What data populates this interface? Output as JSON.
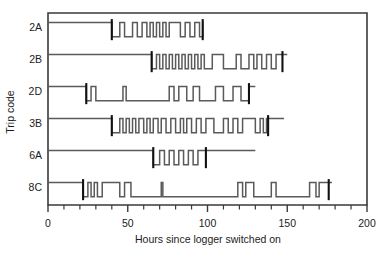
{
  "chart_data": {
    "type": "line",
    "title": "",
    "xlabel": "Hours since logger switched on",
    "ylabel": "Trip code",
    "xlim": [
      0,
      200
    ],
    "xticks": [
      0,
      50,
      100,
      150,
      200
    ],
    "xtick_labels": [
      "0",
      "50",
      "100",
      "150",
      "200"
    ],
    "x_minor_tick_step": 10,
    "grid": false,
    "legend": null,
    "categories": [
      "2A",
      "2B",
      "2D",
      "3B",
      "6A",
      "8C"
    ],
    "note": "Each row is a binary on/off (high/low) step trace versus hours; thick black vertical bars mark the start and end of the active logging window for each trip.",
    "series": [
      {
        "name": "2A",
        "baseline_start": 0,
        "marker_start": 40,
        "marker_end": 97,
        "trace_end": 97,
        "steps": [
          [
            0,
            1
          ],
          [
            40,
            0
          ],
          [
            45,
            1
          ],
          [
            48,
            0
          ],
          [
            53,
            1
          ],
          [
            56,
            0
          ],
          [
            59,
            1
          ],
          [
            62,
            0
          ],
          [
            64,
            1
          ],
          [
            66,
            0
          ],
          [
            68,
            1
          ],
          [
            70,
            0
          ],
          [
            72,
            1
          ],
          [
            74,
            0
          ],
          [
            76,
            1
          ],
          [
            83,
            0
          ],
          [
            86,
            1
          ],
          [
            89,
            0
          ],
          [
            92,
            1
          ],
          [
            95,
            0
          ],
          [
            97,
            1
          ]
        ]
      },
      {
        "name": "2B",
        "baseline_start": 0,
        "marker_start": 65,
        "marker_end": 147,
        "trace_end": 150,
        "steps": [
          [
            0,
            1
          ],
          [
            65,
            0
          ],
          [
            68,
            1
          ],
          [
            70,
            0
          ],
          [
            72,
            1
          ],
          [
            74,
            0
          ],
          [
            76,
            1
          ],
          [
            78,
            0
          ],
          [
            80,
            1
          ],
          [
            82,
            0
          ],
          [
            84,
            1
          ],
          [
            86,
            0
          ],
          [
            88,
            1
          ],
          [
            90,
            0
          ],
          [
            92,
            1
          ],
          [
            94,
            0
          ],
          [
            96,
            1
          ],
          [
            98,
            0
          ],
          [
            103,
            1
          ],
          [
            110,
            0
          ],
          [
            118,
            1
          ],
          [
            121,
            0
          ],
          [
            126,
            1
          ],
          [
            129,
            0
          ],
          [
            131,
            1
          ],
          [
            134,
            0
          ],
          [
            137,
            1
          ],
          [
            140,
            0
          ],
          [
            143,
            1
          ],
          [
            147,
            1
          ]
        ]
      },
      {
        "name": "2D",
        "baseline_start": 0,
        "marker_start": 24,
        "marker_end": 126,
        "trace_end": 130,
        "steps": [
          [
            0,
            1
          ],
          [
            24,
            0
          ],
          [
            27,
            1
          ],
          [
            30,
            0
          ],
          [
            47,
            1
          ],
          [
            49,
            0
          ],
          [
            76,
            1
          ],
          [
            79,
            0
          ],
          [
            82,
            1
          ],
          [
            87,
            0
          ],
          [
            91,
            1
          ],
          [
            95,
            0
          ],
          [
            105,
            1
          ],
          [
            110,
            0
          ],
          [
            116,
            1
          ],
          [
            121,
            0
          ],
          [
            126,
            1
          ]
        ]
      },
      {
        "name": "3B",
        "baseline_start": 0,
        "marker_start": 40,
        "marker_end": 138,
        "trace_end": 148,
        "steps": [
          [
            0,
            1
          ],
          [
            40,
            0
          ],
          [
            45,
            1
          ],
          [
            47,
            0
          ],
          [
            49,
            1
          ],
          [
            51,
            0
          ],
          [
            53,
            1
          ],
          [
            55,
            0
          ],
          [
            57,
            1
          ],
          [
            60,
            0
          ],
          [
            62,
            1
          ],
          [
            64,
            0
          ],
          [
            66,
            1
          ],
          [
            69,
            0
          ],
          [
            71,
            1
          ],
          [
            74,
            0
          ],
          [
            77,
            1
          ],
          [
            80,
            0
          ],
          [
            83,
            1
          ],
          [
            85,
            0
          ],
          [
            87,
            1
          ],
          [
            90,
            0
          ],
          [
            93,
            1
          ],
          [
            96,
            0
          ],
          [
            99,
            1
          ],
          [
            104,
            0
          ],
          [
            110,
            1
          ],
          [
            113,
            0
          ],
          [
            116,
            1
          ],
          [
            119,
            0
          ],
          [
            122,
            1
          ],
          [
            130,
            0
          ],
          [
            133,
            1
          ],
          [
            135,
            0
          ],
          [
            137,
            1
          ],
          [
            138,
            1
          ]
        ]
      },
      {
        "name": "6A",
        "baseline_start": 0,
        "marker_start": 66,
        "marker_end": 99,
        "trace_end": 130,
        "steps": [
          [
            0,
            1
          ],
          [
            66,
            0
          ],
          [
            70,
            1
          ],
          [
            73,
            0
          ],
          [
            76,
            1
          ],
          [
            79,
            0
          ],
          [
            82,
            1
          ],
          [
            85,
            0
          ],
          [
            88,
            1
          ],
          [
            91,
            0
          ],
          [
            94,
            1
          ],
          [
            99,
            1
          ]
        ]
      },
      {
        "name": "8C",
        "baseline_start": 0,
        "marker_start": 22,
        "marker_end": 176,
        "trace_end": 178,
        "steps": [
          [
            0,
            1
          ],
          [
            22,
            0
          ],
          [
            25,
            1
          ],
          [
            27,
            0
          ],
          [
            29,
            1
          ],
          [
            31,
            0
          ],
          [
            34,
            1
          ],
          [
            45,
            0
          ],
          [
            48,
            1
          ],
          [
            52,
            0
          ],
          [
            71,
            1
          ],
          [
            72,
            0
          ],
          [
            119,
            1
          ],
          [
            122,
            0
          ],
          [
            124,
            1
          ],
          [
            129,
            0
          ],
          [
            140,
            1
          ],
          [
            143,
            0
          ],
          [
            164,
            1
          ],
          [
            168,
            0
          ],
          [
            170,
            1
          ],
          [
            176,
            1
          ]
        ]
      }
    ]
  }
}
